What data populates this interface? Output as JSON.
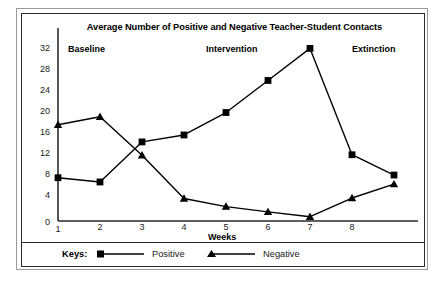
{
  "chart_data": {
    "type": "line",
    "title": "Average Number of Positive and Negative Teacher-Student Contacts",
    "xlabel": "Weeks",
    "ylabel": "",
    "x": [
      1,
      2,
      3,
      4,
      5,
      6,
      7,
      8,
      9
    ],
    "xtick_labels": [
      "1",
      "2",
      "3",
      "4",
      "5",
      "6",
      "7",
      "8"
    ],
    "ytick_labels": [
      "0",
      "4",
      "8",
      "12",
      "16",
      "20",
      "24",
      "28",
      "32"
    ],
    "ylim": [
      0,
      34
    ],
    "xlim": [
      1,
      9
    ],
    "grid": false,
    "legend_position": "below-plot",
    "legend_title": "Keys:",
    "series": [
      {
        "name": "Positive",
        "marker": "square",
        "color": "#000000",
        "values": [
          8.1,
          7.3,
          14.8,
          16.1,
          20.3,
          26.3,
          32.3,
          12.4,
          8.6
        ]
      },
      {
        "name": "Negative",
        "marker": "triangle",
        "color": "#000000",
        "values": [
          18.0,
          19.5,
          12.3,
          4.2,
          2.7,
          1.7,
          0.8,
          4.3,
          6.9
        ]
      }
    ],
    "annotations": [
      {
        "text": "Baseline",
        "phase_weeks": [
          1,
          3
        ]
      },
      {
        "text": "Intervention",
        "phase_weeks": [
          3,
          7
        ]
      },
      {
        "text": "Extinction",
        "phase_weeks": [
          7,
          9
        ]
      }
    ]
  },
  "phases": {
    "baseline": "Baseline",
    "intervention": "Intervention",
    "extinction": "Extinction"
  },
  "axes": {
    "yticks": [
      "32",
      "28",
      "24",
      "20",
      "16",
      "12",
      "8",
      "4",
      "0"
    ],
    "xticks": [
      "1",
      "2",
      "3",
      "4",
      "5",
      "6",
      "7",
      "8"
    ],
    "xlabel": "Weeks"
  },
  "legend": {
    "title": "Keys:",
    "entries": [
      {
        "label": "Positive",
        "marker": "square-marker"
      },
      {
        "label": "Negative",
        "marker": "triangle-marker"
      }
    ]
  }
}
